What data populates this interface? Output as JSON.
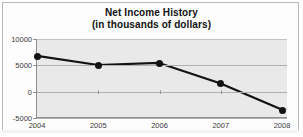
{
  "figure": {
    "title_main": "Net Income History",
    "title_sub": "(in thousands of dollars)",
    "frame_color": "#b9b9b9",
    "plot_background": "#e9e9e9",
    "series_color": "#121212"
  },
  "chart_data": {
    "type": "line",
    "title": "Net Income History (in thousands of dollars)",
    "xlabel": "",
    "ylabel": "",
    "categories": [
      "2004",
      "2005",
      "2006",
      "2007",
      "2008"
    ],
    "values": [
      6750,
      5000,
      5400,
      1500,
      -3500
    ],
    "ytick_labels": [
      "10000",
      "5000",
      "0",
      "-5000"
    ],
    "ytick_values": [
      10000,
      5000,
      0,
      -5000
    ],
    "ylim": [
      -5000,
      10000
    ],
    "grid": true,
    "legend": "none",
    "markers": "filled-circle"
  }
}
